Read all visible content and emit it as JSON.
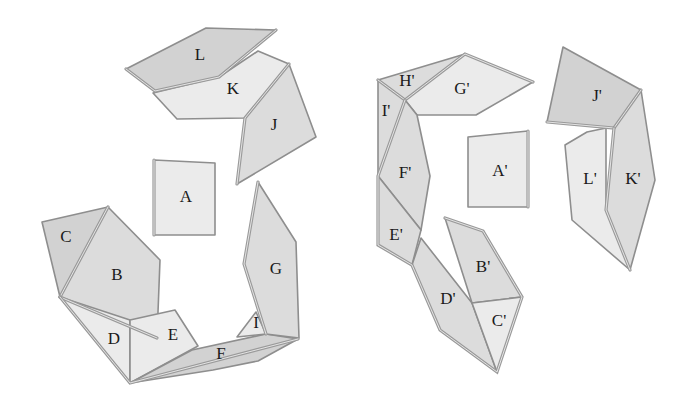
{
  "diagram": {
    "title": "",
    "colors": {
      "background": "#ffffff",
      "dark_face": "#d2d2d2",
      "mid_face": "#dcdcdc",
      "light_face": "#ebebeb",
      "stroke": "#8e8e8e",
      "label": "#1a1a1a"
    },
    "left_figure": {
      "pieces": [
        {
          "id": "L",
          "label": "L",
          "shade": "dark",
          "points": "126,69 206,28 276,30 219,77 155,91",
          "label_pos": [
            200,
            56
          ]
        },
        {
          "id": "K",
          "label": "K",
          "shade": "light",
          "points": "153,93 219,77 258,51 289,64 245,118 177,119",
          "label_pos": [
            233,
            90
          ]
        },
        {
          "id": "J",
          "label": "J",
          "shade": "mid",
          "points": "289,64 316,137 237,184 245,118",
          "label_pos": [
            274,
            126
          ]
        },
        {
          "id": "A",
          "label": "A",
          "shade": "light",
          "points": "154,160 215,163 215,235 154,235",
          "label_pos": [
            186,
            198
          ]
        },
        {
          "id": "C",
          "label": "C",
          "shade": "dark",
          "points": "42,222 108,207 60,297",
          "label_pos": [
            66,
            238
          ]
        },
        {
          "id": "B",
          "label": "B",
          "shade": "mid",
          "points": "108,207 160,260 157,338 60,297",
          "label_pos": [
            117,
            276
          ]
        },
        {
          "id": "D",
          "label": "D",
          "shade": "light",
          "points": "60,297 130,320 130,383",
          "label_pos": [
            114,
            340
          ]
        },
        {
          "id": "E",
          "label": "E",
          "shade": "light",
          "points": "130,320 175,310 198,346 130,383",
          "label_pos": [
            173,
            336
          ]
        },
        {
          "id": "F",
          "label": "F",
          "shade": "dark",
          "points": "130,383 192,350 266,334 298,339 258,361 213,370",
          "label_pos": [
            221,
            355
          ]
        },
        {
          "id": "I",
          "label": "I",
          "shade": "light",
          "points": "237,337 256,312 266,334",
          "label_pos": [
            256,
            324
          ]
        },
        {
          "id": "G",
          "label": "G",
          "shade": "mid",
          "points": "258,182 296,242 299,338 266,334 244,264",
          "label_pos": [
            276,
            270
          ]
        }
      ]
    },
    "right_figure": {
      "pieces": [
        {
          "id": "H'",
          "label": "H'",
          "shade": "mid",
          "points": "378,80 465,54 405,100",
          "label_pos": [
            407,
            82
          ]
        },
        {
          "id": "G'",
          "label": "G'",
          "shade": "light",
          "points": "465,54 533,82 476,115 417,115 405,100",
          "label_pos": [
            462,
            90
          ]
        },
        {
          "id": "I'",
          "label": "I'",
          "shade": "mid",
          "points": "378,80 405,100 378,176",
          "label_pos": [
            386,
            112
          ]
        },
        {
          "id": "F'",
          "label": "F'",
          "shade": "mid",
          "points": "405,100 417,115 430,176 421,230 378,176",
          "label_pos": [
            405,
            174
          ]
        },
        {
          "id": "E'",
          "label": "E'",
          "shade": "mid",
          "points": "378,176 421,230 412,265 378,245",
          "label_pos": [
            396,
            236
          ]
        },
        {
          "id": "D'",
          "label": "D'",
          "shade": "mid",
          "points": "412,265 421,238 472,303 497,372 440,330",
          "label_pos": [
            448,
            300
          ]
        },
        {
          "id": "A'",
          "label": "A'",
          "shade": "light",
          "points": "468,137 528,131 528,207 468,207",
          "label_pos": [
            500,
            172
          ]
        },
        {
          "id": "B'",
          "label": "B'",
          "shade": "mid",
          "points": "445,218 483,231 522,297 472,303",
          "label_pos": [
            483,
            268
          ]
        },
        {
          "id": "C'",
          "label": "C'",
          "shade": "light",
          "points": "472,303 522,297 497,372",
          "label_pos": [
            499,
            322
          ]
        },
        {
          "id": "J'",
          "label": "J'",
          "shade": "dark",
          "points": "563,47 641,90 614,128 547,122",
          "label_pos": [
            597,
            97
          ]
        },
        {
          "id": "K'",
          "label": "K'",
          "shade": "mid",
          "points": "641,90 655,180 630,270 606,210 614,128",
          "label_pos": [
            633,
            180
          ]
        },
        {
          "id": "L'",
          "label": "L'",
          "shade": "light",
          "points": "606,128 606,210 630,270 572,220 565,145 587,132",
          "label_pos": [
            590,
            180
          ]
        }
      ]
    },
    "hinge_edges": [
      "126,69 155,91 219,77 276,30",
      "289,64 245,118 237,184",
      "154,160 154,235",
      "60,297 108,207",
      "60,297 157,338",
      "60,297 130,383 298,339",
      "258,182 244,264 266,334",
      "378,80 405,100 465,54 533,82",
      "405,100 378,176 378,245 412,265 440,330 497,372 522,297 483,231 445,218",
      "528,131 528,207",
      "547,122 614,128 641,90",
      "614,128 606,210 630,270"
    ]
  }
}
